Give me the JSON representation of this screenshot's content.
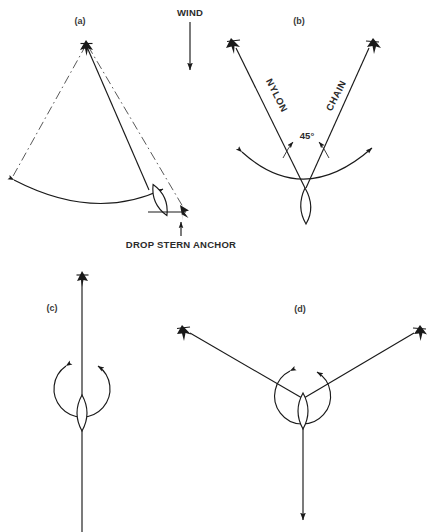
{
  "figure": {
    "domain_kind": "technical-line-diagram",
    "background_color": "#ffffff",
    "ink_color": "#1a1a1a",
    "cut_off_header_text": "",
    "panels": [
      {
        "id": "a",
        "label": "(a)",
        "label_x": 80,
        "label_y": 24,
        "description": "Bow anchor set with vessel swinging on an arc, stern anchor being dropped",
        "annotations": [
          {
            "name": "drop-stern-anchor",
            "text": "DROP STERN ANCHOR",
            "x": 181,
            "y": 244
          }
        ]
      },
      {
        "id": "b",
        "label": "(b)",
        "label_x": 299,
        "label_y": 24,
        "description": "Two anchors set at a 45 degree included angle, nylon rode to port, chain rode to starboard",
        "annotations": [
          {
            "name": "nylon-rode-label",
            "text": "NYLON",
            "x": 274,
            "y": 97,
            "rotation": 57
          },
          {
            "name": "chain-rode-label",
            "text": "CHAIN",
            "x": 337,
            "y": 97,
            "rotation": -57
          },
          {
            "name": "angle-label",
            "text": "45°",
            "x": 307,
            "y": 136
          }
        ]
      },
      {
        "id": "c",
        "label": "(c)",
        "label_x": 52,
        "label_y": 308,
        "description": "Bahamian moor, single fore and aft rode with full circular swing",
        "annotations": []
      },
      {
        "id": "d",
        "label": "(d)",
        "label_x": 300,
        "label_y": 310,
        "description": "Three point moor with two bow rodes and one stern rode",
        "annotations": []
      }
    ],
    "wind": {
      "label": "WIND",
      "label_x": 190,
      "label_y": 16,
      "direction": "down",
      "arrow_from_y": 22,
      "arrow_to_y": 76
    },
    "legend_symbols": [
      {
        "name": "anchor-symbol",
        "meaning": "Set anchor (fluke)"
      },
      {
        "name": "boat-hull-symbol",
        "meaning": "Vessel hull, plan view"
      },
      {
        "name": "swing-arc-symbol",
        "meaning": "Arc of swing with double arrow heads"
      },
      {
        "name": "rode-line-symbol",
        "meaning": "Anchor rode / line"
      },
      {
        "name": "dashed-rode-symbol",
        "meaning": "Alternate / previous rode position"
      }
    ]
  }
}
